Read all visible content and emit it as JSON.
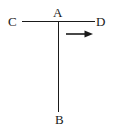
{
  "figure": {
    "background_color": "#ffffff",
    "stroke_color": "#1a1a1a",
    "labels": {
      "a": "A",
      "b": "B",
      "c": "C",
      "d": "D"
    },
    "segments": [
      {
        "name": "horizontal-segment-CD",
        "from_label": "C",
        "to_label": "D",
        "x1": 22,
        "y1": 21.5,
        "x2": 95,
        "y2": 21.5
      },
      {
        "name": "vertical-segment-AB",
        "from_label": "A",
        "to_label": "B",
        "x1": 58.5,
        "y1": 21,
        "x2": 58.5,
        "y2": 112
      }
    ],
    "arrow": {
      "name": "direction-arrow",
      "direction": "right",
      "shaft_x1": 66,
      "shaft_x2": 87,
      "tip_x": 93,
      "y": 34,
      "head_half_height": 3.6
    },
    "vertices": [
      {
        "label": "A",
        "x": 58.5,
        "y": 21
      },
      {
        "label": "B",
        "x": 58.5,
        "y": 112
      },
      {
        "label": "C",
        "x": 22,
        "y": 21.5
      },
      {
        "label": "D",
        "x": 95,
        "y": 21.5
      }
    ]
  }
}
